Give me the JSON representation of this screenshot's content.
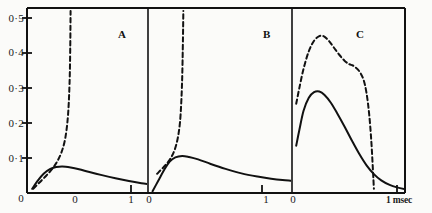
{
  "figure": {
    "background_color": "#fbfbf9",
    "ink_color": "#111111",
    "panel_labels": [
      {
        "text": "A",
        "x": 118,
        "y": 28
      },
      {
        "text": "B",
        "x": 263,
        "y": 28
      },
      {
        "text": "C",
        "x": 356,
        "y": 28
      }
    ],
    "axis_unit_label": {
      "text": "1 msec",
      "x": 386,
      "y": 196
    }
  },
  "chart_data": {
    "type": "line",
    "title": "",
    "xlabel": "1 msec",
    "ylabel": "",
    "ylim": [
      0,
      0.5
    ],
    "xlim": [
      0,
      1.25
    ],
    "grid": false,
    "legend": "none",
    "y_ticks": [
      {
        "value": 0.5,
        "label": "0·5"
      },
      {
        "value": 0.4,
        "label": "0·4"
      },
      {
        "value": 0.3,
        "label": "0·3"
      },
      {
        "value": 0.2,
        "label": "0·2"
      },
      {
        "value": 0.1,
        "label": "0·1"
      },
      {
        "value": 0.0,
        "label": "0"
      }
    ],
    "x_ticks": [
      {
        "value": 0,
        "label": "0"
      },
      {
        "value": 1,
        "label": "1"
      }
    ],
    "panels": [
      {
        "name": "A",
        "label": "A",
        "series": [
          {
            "name": "dashed-A",
            "style": "dashed",
            "note": "rises steeply and becomes asymptotic vertical near x=0.42",
            "x": [
              0.06,
              0.12,
              0.18,
              0.24,
              0.29,
              0.33,
              0.36,
              0.38,
              0.395,
              0.405,
              0.412,
              0.416,
              0.418,
              0.419
            ],
            "y": [
              0.012,
              0.03,
              0.048,
              0.068,
              0.09,
              0.115,
              0.145,
              0.18,
              0.225,
              0.28,
              0.345,
              0.42,
              0.48,
              0.52
            ]
          },
          {
            "name": "solid-A",
            "style": "solid",
            "note": "low broad hump peaking near 0.075",
            "x": [
              0.05,
              0.1,
              0.16,
              0.22,
              0.28,
              0.34,
              0.42,
              0.5,
              0.6,
              0.72,
              0.85,
              0.98,
              1.1,
              1.2,
              1.25
            ],
            "y": [
              0.012,
              0.034,
              0.055,
              0.068,
              0.074,
              0.076,
              0.073,
              0.068,
              0.06,
              0.051,
              0.042,
              0.034,
              0.028,
              0.024,
              0.022
            ]
          }
        ]
      },
      {
        "name": "B",
        "label": "B",
        "series": [
          {
            "name": "dashed-B",
            "style": "dashed",
            "note": "rises steeply and becomes asymptotic vertical near x=0.30",
            "x": [
              0.08,
              0.14,
              0.19,
              0.23,
              0.26,
              0.28,
              0.292,
              0.3,
              0.305,
              0.308,
              0.31
            ],
            "y": [
              0.055,
              0.075,
              0.095,
              0.12,
              0.155,
              0.2,
              0.26,
              0.33,
              0.41,
              0.47,
              0.52
            ]
          },
          {
            "name": "solid-B",
            "style": "solid",
            "note": "hump peaking near 0.105, decays to a low tail",
            "x": [
              0.04,
              0.09,
              0.14,
              0.19,
              0.24,
              0.3,
              0.36,
              0.44,
              0.55,
              0.68,
              0.82,
              0.96,
              1.08,
              1.18,
              1.25
            ],
            "y": [
              0.005,
              0.035,
              0.065,
              0.09,
              0.102,
              0.106,
              0.103,
              0.096,
              0.083,
              0.069,
              0.056,
              0.047,
              0.041,
              0.037,
              0.035
            ]
          }
        ]
      },
      {
        "name": "C",
        "label": "C",
        "series": [
          {
            "name": "dashed-C",
            "style": "dashed",
            "note": "large hump peaking near 0.45 with a shoulder plateau near 0.36, then steep fall to baseline near x=0.78",
            "x": [
              0.04,
              0.07,
              0.11,
              0.16,
              0.21,
              0.26,
              0.3,
              0.35,
              0.4,
              0.45,
              0.5,
              0.545,
              0.575,
              0.6,
              0.64,
              0.68,
              0.71,
              0.735,
              0.755,
              0.77,
              0.78
            ],
            "y": [
              0.255,
              0.3,
              0.355,
              0.405,
              0.435,
              0.448,
              0.448,
              0.435,
              0.415,
              0.395,
              0.378,
              0.368,
              0.365,
              0.36,
              0.348,
              0.325,
              0.285,
              0.225,
              0.15,
              0.07,
              0.012
            ]
          },
          {
            "name": "solid-C",
            "style": "solid",
            "note": "hump peaking near 0.29, decaying to a long low tail",
            "x": [
              0.04,
              0.07,
              0.11,
              0.16,
              0.21,
              0.26,
              0.31,
              0.37,
              0.43,
              0.5,
              0.57,
              0.64,
              0.71,
              0.78,
              0.85,
              0.93,
              1.0,
              1.08,
              1.15
            ],
            "y": [
              0.135,
              0.18,
              0.235,
              0.272,
              0.288,
              0.29,
              0.28,
              0.258,
              0.228,
              0.19,
              0.15,
              0.112,
              0.079,
              0.054,
              0.036,
              0.023,
              0.016,
              0.011,
              0.008
            ]
          }
        ]
      }
    ]
  }
}
